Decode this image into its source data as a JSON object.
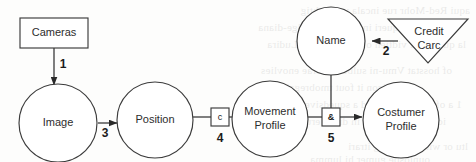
{
  "diagram": {
    "background_color": "#fdfdfc",
    "stroke_color": "#3b3b3b",
    "nodes": [
      {
        "id": "cameras",
        "label": "Cameras",
        "shape": "rectangle"
      },
      {
        "id": "image",
        "label": "Image",
        "shape": "circle"
      },
      {
        "id": "position",
        "label": "Position",
        "shape": "circle"
      },
      {
        "id": "movement_profile",
        "label_line1": "Movement",
        "label_line2": "Profile",
        "shape": "circle"
      },
      {
        "id": "name",
        "label": "Name",
        "shape": "circle"
      },
      {
        "id": "credit_card",
        "label_line1": "Credit",
        "label_line2": "Carc",
        "shape": "triangle"
      },
      {
        "id": "costumer_profile",
        "label_line1": "Costumer",
        "label_line2": "Profile",
        "shape": "circle"
      }
    ],
    "junctions": [
      {
        "id": "junction-c",
        "symbol": "c",
        "shape": "small-box"
      },
      {
        "id": "junction-and",
        "symbol": "&",
        "shape": "small-box"
      }
    ],
    "edges": [
      {
        "id": "edge-1",
        "label": "1",
        "from": "cameras",
        "to": "image",
        "arrow": true
      },
      {
        "id": "edge-2",
        "label": "2",
        "from": "credit_card",
        "to": "name",
        "arrow": true
      },
      {
        "id": "edge-3",
        "label": "3",
        "from": "image",
        "to": "position",
        "arrow": true
      },
      {
        "id": "edge-4",
        "label": "4",
        "from": "position",
        "to": "movement_profile",
        "arrow": true
      },
      {
        "id": "edge-5",
        "label": "5",
        "from": "movement_profile",
        "to": "costumer_profile",
        "arrow": true
      },
      {
        "id": "edge-name-and",
        "label": "",
        "from": "name",
        "to": "junction-and",
        "arrow": false
      }
    ]
  },
  "ghost_text": {
    "lines": [
      "aqui Red-Mohr rue incala vec lichtig",
      "mber ube Laqueri  info ricomura alge-diana",
      "la quarter of vidtien of ukuspha ru a Ludira",
      "of hosstat Vmu-ni sulbert riferae enovlies",
      "fu-ubcicon it fout tmobregals",
      "1 a of a iwicer i pinnd a squedsiver",
      "idera l arviara ruit in dieda erue-dimonot",
      "ltu or witarer insting itrari",
      "ounlosbe gumer    hi    lumma"
    ]
  }
}
